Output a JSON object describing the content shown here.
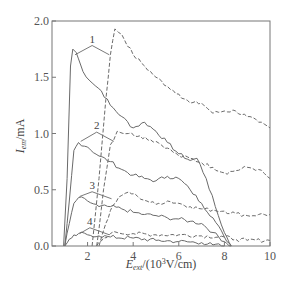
{
  "chart_data": {
    "type": "line",
    "title": "",
    "xlabel": "E_ext/(10^3 V/cm)",
    "xlabel_parts": {
      "main": "E",
      "sub": "ext",
      "rest": "/(10",
      "sup": "3",
      "tail": "V/cm)"
    },
    "ylabel": "I_em/mA",
    "ylabel_parts": {
      "main": "I",
      "sub": "em",
      "rest": "/mA"
    },
    "xlim": [
      0.44,
      10
    ],
    "ylim": [
      0,
      2.0
    ],
    "xticks": [
      2,
      4,
      6,
      8,
      10
    ],
    "xtick_labels": [
      "2",
      "4",
      "6",
      "8",
      "10"
    ],
    "yticks": [
      0.0,
      0.5,
      1.0,
      1.5,
      2.0
    ],
    "ytick_labels": [
      "0.0",
      "0.5",
      "1.0",
      "1.5",
      "2.0"
    ],
    "grid": false,
    "legend": "none; curves labeled inline 1-4 (solid = lower-field, dashed = higher-field pair)",
    "series": [
      {
        "name": "1 (solid)",
        "style": "solid",
        "x": [
          0.95,
          1.1,
          1.25,
          1.35,
          1.5,
          1.8,
          2.2,
          2.6,
          3.0,
          3.5,
          4.0,
          4.5,
          5.0,
          5.5,
          6.0,
          6.5,
          6.8,
          7.2,
          7.6,
          8.0,
          8.3
        ],
        "y": [
          0.0,
          0.6,
          1.6,
          1.75,
          1.72,
          1.55,
          1.45,
          1.38,
          1.25,
          1.15,
          1.05,
          1.1,
          1.02,
          0.92,
          0.82,
          0.76,
          0.78,
          0.6,
          0.35,
          0.12,
          0.0
        ]
      },
      {
        "name": "1 (dashed)",
        "style": "dashed",
        "x": [
          2.2,
          2.5,
          2.8,
          3.0,
          3.2,
          3.5,
          4.0,
          4.5,
          5.0,
          5.5,
          6.0,
          6.5,
          7.0,
          7.5,
          8.0,
          8.5,
          9.0,
          9.5,
          10.0
        ],
        "y": [
          0.0,
          0.6,
          1.3,
          1.7,
          1.93,
          1.88,
          1.7,
          1.6,
          1.5,
          1.42,
          1.35,
          1.27,
          1.27,
          1.18,
          1.2,
          1.2,
          1.15,
          1.1,
          1.05
        ]
      },
      {
        "name": "2 (solid)",
        "style": "solid",
        "x": [
          1.0,
          1.2,
          1.4,
          1.6,
          2.0,
          2.5,
          3.0,
          3.5,
          4.0,
          4.5,
          5.0,
          5.5,
          6.0,
          6.5,
          7.0,
          7.5,
          8.0,
          8.3
        ],
        "y": [
          0.0,
          0.4,
          0.85,
          0.92,
          0.88,
          0.8,
          0.75,
          0.68,
          0.63,
          0.6,
          0.58,
          0.62,
          0.6,
          0.5,
          0.38,
          0.25,
          0.08,
          0.0
        ]
      },
      {
        "name": "2 (dashed)",
        "style": "dashed",
        "x": [
          2.4,
          2.7,
          3.0,
          3.3,
          3.8,
          4.3,
          5.0,
          5.5,
          6.0,
          6.5,
          7.0,
          7.5,
          8.0,
          8.5,
          9.0,
          9.5,
          10.0
        ],
        "y": [
          0.0,
          0.5,
          0.9,
          1.02,
          1.0,
          0.98,
          0.93,
          0.87,
          0.8,
          0.78,
          0.74,
          0.7,
          0.65,
          0.67,
          0.7,
          0.68,
          0.6
        ]
      },
      {
        "name": "3 (solid)",
        "style": "solid",
        "x": [
          1.0,
          1.2,
          1.4,
          1.6,
          2.0,
          2.5,
          3.0,
          3.5,
          4.0,
          4.5,
          5.0,
          5.5,
          6.0,
          6.5,
          7.0,
          7.5,
          8.0,
          8.3
        ],
        "y": [
          0.0,
          0.2,
          0.38,
          0.43,
          0.4,
          0.35,
          0.35,
          0.33,
          0.3,
          0.28,
          0.27,
          0.25,
          0.24,
          0.22,
          0.2,
          0.12,
          0.04,
          0.0
        ]
      },
      {
        "name": "3 (dashed)",
        "style": "dashed",
        "x": [
          2.5,
          2.8,
          3.1,
          3.5,
          3.8,
          4.2,
          4.6,
          5.0,
          5.5,
          6.0,
          6.5,
          7.0,
          7.5,
          8.0,
          8.5,
          9.0,
          9.5,
          10.0
        ],
        "y": [
          0.0,
          0.2,
          0.36,
          0.45,
          0.48,
          0.44,
          0.4,
          0.37,
          0.4,
          0.38,
          0.35,
          0.33,
          0.32,
          0.31,
          0.29,
          0.27,
          0.28,
          0.28
        ]
      },
      {
        "name": "4 (solid)",
        "style": "solid",
        "x": [
          1.0,
          1.3,
          1.6,
          2.0,
          2.5,
          3.0,
          4.0,
          5.0,
          6.0,
          7.0,
          7.5,
          8.0
        ],
        "y": [
          0.0,
          0.07,
          0.11,
          0.1,
          0.09,
          0.08,
          0.07,
          0.05,
          0.04,
          0.03,
          0.01,
          0.0
        ]
      },
      {
        "name": "4 (dashed)",
        "style": "dashed",
        "x": [
          2.4,
          2.7,
          3.0,
          3.3,
          4.0,
          5.0,
          6.0,
          7.0,
          8.0,
          8.5,
          9.0,
          10.0
        ],
        "y": [
          0.0,
          0.07,
          0.11,
          0.12,
          0.11,
          0.1,
          0.1,
          0.09,
          0.08,
          0.06,
          0.05,
          0.05
        ]
      }
    ],
    "annotations": [
      {
        "text": "1",
        "x": 2.2,
        "y": 1.8
      },
      {
        "text": "2",
        "x": 2.4,
        "y": 1.03
      },
      {
        "text": "3",
        "x": 2.2,
        "y": 0.5
      },
      {
        "text": "4",
        "x": 2.1,
        "y": 0.18
      }
    ]
  },
  "style": {
    "line_color": "#6a6a6a",
    "axis_color": "#777777",
    "text_color": "#444444"
  }
}
